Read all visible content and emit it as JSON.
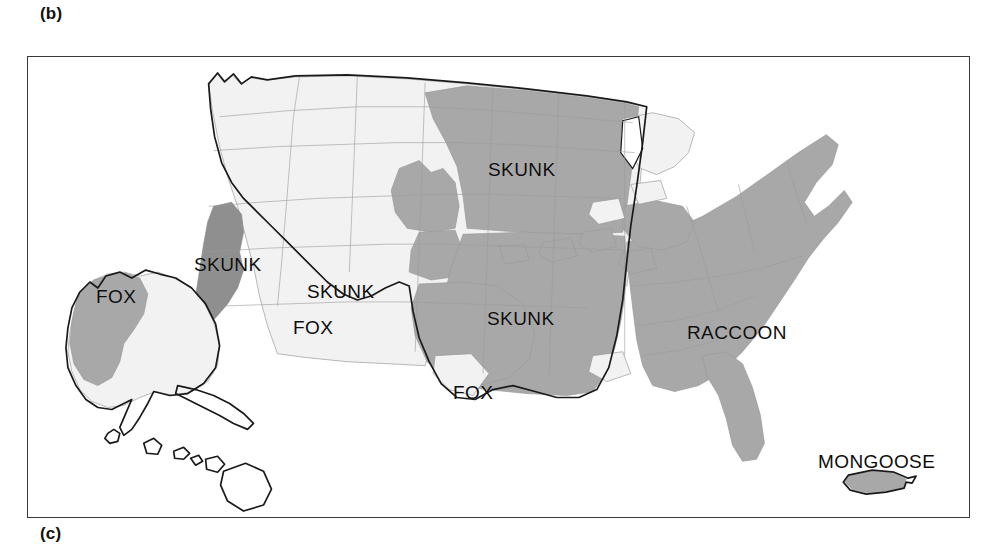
{
  "figure": {
    "panel_b_letter": "(b)",
    "panel_c_letter": "(c)"
  },
  "map": {
    "title_visible": false,
    "region": "United States with Alaska, Hawaii and Puerto Rico insets",
    "colors": {
      "shaded_medium": "#a8a8a8",
      "shaded_dark": "#8f8f8f",
      "unshaded_light": "#f2f2f2",
      "background": "#ffffff",
      "border_dark": "#1a1a1a",
      "border_light": "#9a9a9a",
      "frame": "#3a3a3a",
      "label_text": "#0d0d0d"
    },
    "labels": [
      {
        "text": "SKUNK",
        "x": 487,
        "y": 158,
        "name": "label-skunk-north-central"
      },
      {
        "text": "SKUNK",
        "x": 193,
        "y": 253,
        "name": "label-skunk-california"
      },
      {
        "text": "SKUNK",
        "x": 306,
        "y": 280,
        "name": "label-skunk-arizona"
      },
      {
        "text": "SKUNK",
        "x": 486,
        "y": 307,
        "name": "label-skunk-south-central"
      },
      {
        "text": "FOX",
        "x": 95,
        "y": 285,
        "name": "label-fox-alaska"
      },
      {
        "text": "FOX",
        "x": 292,
        "y": 316,
        "name": "label-fox-arizona"
      },
      {
        "text": "FOX",
        "x": 452,
        "y": 381,
        "name": "label-fox-texas"
      },
      {
        "text": "RACCOON",
        "x": 686,
        "y": 321,
        "name": "label-raccoon-southeast"
      },
      {
        "text": "MONGOOSE",
        "x": 817,
        "y": 450,
        "name": "label-mongoose-puerto-rico"
      }
    ]
  }
}
